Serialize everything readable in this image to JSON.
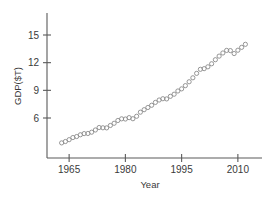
{
  "chart_data": {
    "type": "scatter",
    "title": "",
    "xlabel": "Year",
    "ylabel": "GDP($T)",
    "xlim": [
      1961.5,
      2013.5
    ],
    "ylim": [
      2.6,
      17.4
    ],
    "xticks": [
      1965,
      1980,
      1995,
      2010
    ],
    "xtick_labels": [
      "1965",
      "1980",
      "1995",
      "2010"
    ],
    "yticks": [
      6,
      9,
      12,
      15
    ],
    "ytick_labels": [
      "6",
      "9",
      "12",
      "15"
    ],
    "grid": false,
    "legend": null,
    "marker": "open-circle",
    "marker_color": "#8a8a8a",
    "axis_color": "#5a5a5a",
    "x": [
      1963,
      1964,
      1965,
      1966,
      1967,
      1968,
      1969,
      1970,
      1971,
      1972,
      1973,
      1974,
      1975,
      1976,
      1977,
      1978,
      1979,
      1980,
      1981,
      1982,
      1983,
      1984,
      1985,
      1986,
      1987,
      1988,
      1989,
      1990,
      1991,
      1992,
      1993,
      1994,
      1995,
      1996,
      1997,
      1998,
      1999,
      2000,
      2001,
      2002,
      2003,
      2004,
      2005,
      2006,
      2007,
      2008,
      2009,
      2010,
      2011,
      2012
    ],
    "y": [
      3.3,
      3.45,
      3.65,
      3.88,
      3.99,
      4.18,
      4.31,
      4.32,
      4.46,
      4.7,
      4.97,
      4.94,
      4.93,
      5.19,
      5.43,
      5.73,
      5.91,
      5.89,
      6.04,
      5.92,
      6.19,
      6.63,
      6.9,
      7.14,
      7.38,
      7.69,
      7.95,
      8.09,
      8.07,
      8.35,
      8.58,
      8.93,
      9.16,
      9.51,
      9.93,
      10.36,
      10.84,
      11.28,
      11.35,
      11.55,
      11.88,
      12.32,
      12.71,
      13.05,
      13.33,
      13.31,
      12.99,
      13.35,
      13.66,
      13.99
    ]
  },
  "axes": {
    "y_title": "GDP($T)",
    "x_title": "Year"
  }
}
